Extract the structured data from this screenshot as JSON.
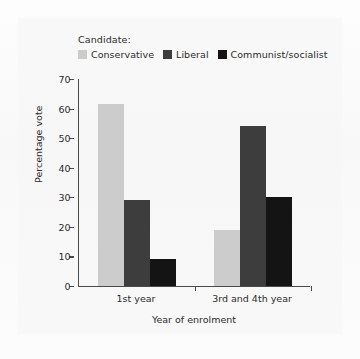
{
  "legend": {
    "title": "Candidate:",
    "entries": [
      {
        "label": "Conservative",
        "color": "#cccccc"
      },
      {
        "label": "Liberal",
        "color": "#3d3d3d"
      },
      {
        "label": "Communist/socialist",
        "color": "#141414"
      }
    ]
  },
  "axes": {
    "y_title": "Percentage vote",
    "x_title": "Year of enrolment",
    "y_ticks": [
      "0",
      "10",
      "20",
      "30",
      "40",
      "50",
      "60",
      "70"
    ]
  },
  "chart_data": {
    "type": "bar",
    "title": "",
    "xlabel": "Year of enrolment",
    "ylabel": "Percentage vote",
    "categories": [
      "1st year",
      "3rd and 4th year"
    ],
    "series": [
      {
        "name": "Conservative",
        "color": "#cccccc",
        "values": [
          61.5,
          19
        ]
      },
      {
        "name": "Liberal",
        "color": "#3d3d3d",
        "values": [
          29,
          54
        ]
      },
      {
        "name": "Communist/socialist",
        "color": "#141414",
        "values": [
          9,
          30
        ]
      }
    ],
    "ylim": [
      0,
      70
    ],
    "ytick_step": 10,
    "grid": false,
    "legend_position": "top"
  }
}
